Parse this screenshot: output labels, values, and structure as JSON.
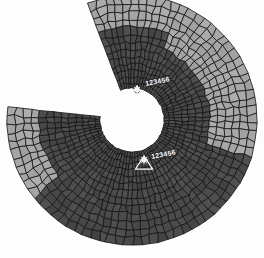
{
  "viewport": {
    "background_color": "#fdfdfd",
    "title": "FEA Mesh Viewport"
  },
  "model": {
    "type": "quad-mesh-annular-sector",
    "center_x": 132,
    "center_y": 120,
    "inner_radius": 32,
    "outer_radius": 125,
    "gap_start_deg": 186,
    "gap_end_deg": 249,
    "radial_divisions": 13,
    "circumferential_divisions": 74,
    "edge_color": "#141414",
    "zone_colors": {
      "primary_dark": "#4a4a4a",
      "secondary_light": "#a6a6a6"
    },
    "zones": [
      {
        "name": "zone-dark-main",
        "color": "#4a4a4a"
      },
      {
        "name": "zone-light-upper-right",
        "color": "#a6a6a6",
        "r_from": 0.52,
        "r_to": 1.0,
        "a_from": -67,
        "a_to": 18
      },
      {
        "name": "zone-light-left-outer",
        "color": "#a6a6a6",
        "r_from": 0.7,
        "r_to": 1.0,
        "a_from": 140,
        "a_to": 186
      },
      {
        "name": "zone-light-lower-outer",
        "color": "#a6a6a6",
        "r_from": 0.7,
        "r_to": 1.0,
        "a_from": 249,
        "a_to": 292
      }
    ]
  },
  "boundary_conditions": [
    {
      "id": "bc-1",
      "label": "123456",
      "symbol": "constraint-triangle",
      "x": 137,
      "y": 99,
      "label_x": 146,
      "label_y": 80,
      "color": "#ffffff"
    },
    {
      "id": "bc-2",
      "label": "123456",
      "symbol": "constraint-triangle",
      "x": 144,
      "y": 169,
      "label_x": 152,
      "label_y": 153,
      "color": "#ffffff"
    }
  ]
}
